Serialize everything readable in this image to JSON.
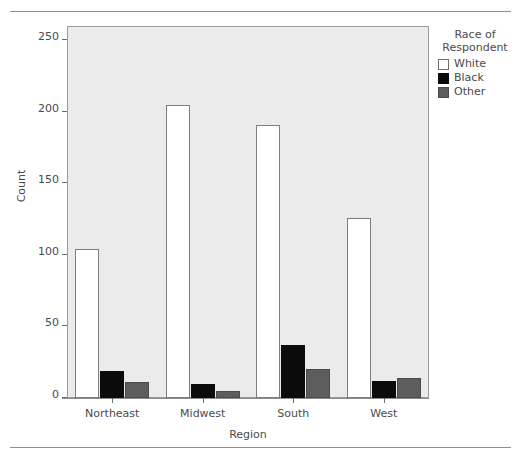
{
  "chart_data": {
    "type": "bar",
    "title": "",
    "xlabel": "Region",
    "ylabel": "Count",
    "categories": [
      "Northeast",
      "Midwest",
      "South",
      "West"
    ],
    "series": [
      {
        "name": "White",
        "color": "#ffffff",
        "values": [
          104,
          205,
          191,
          126
        ]
      },
      {
        "name": "Black",
        "color": "#0b0b0b",
        "values": [
          19,
          10,
          37,
          12
        ]
      },
      {
        "name": "Other",
        "color": "#5d5d5d",
        "values": [
          11,
          5,
          20,
          14
        ]
      }
    ],
    "ylim": [
      0,
      260
    ],
    "yticks": [
      0,
      50,
      100,
      150,
      200,
      250
    ],
    "ytick_labels": [
      "0",
      "50",
      "100",
      "150",
      "200",
      "250"
    ],
    "grid": false,
    "legend_position": "right",
    "legend_title": "Race of Respondent",
    "panel_background": "#ebebeb"
  },
  "axes": {
    "y_title": "Count",
    "x_title": "Region",
    "y_ticks": [
      "250",
      "200",
      "150",
      "100",
      "50",
      "0"
    ],
    "x_ticks": [
      "Northeast",
      "Midwest",
      "South",
      "West"
    ]
  },
  "legend": {
    "title_line1": "Race of",
    "title_line2": "Respondent",
    "items": [
      {
        "label": "White"
      },
      {
        "label": "Black"
      },
      {
        "label": "Other"
      }
    ]
  }
}
